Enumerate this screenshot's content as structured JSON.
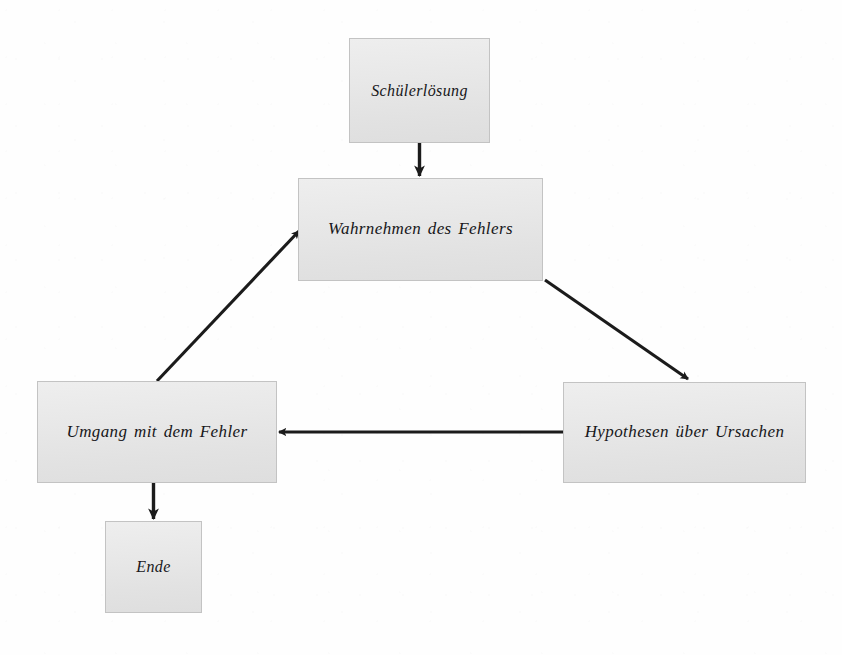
{
  "diagram": {
    "language": "de",
    "background_color": "#fefefe",
    "node_fill_color": "#e8e8e8",
    "node_border_color": "#c3c3c3",
    "edge_color": "#1b1b1b",
    "text_color": "#17171a",
    "nodes": [
      {
        "id": "schuelerloesung",
        "label": "Schülerlösung",
        "x": 349,
        "y": 38,
        "w": 141,
        "h": 105
      },
      {
        "id": "wahrnehmen",
        "label": "Wahrnehmen des Fehlers",
        "x": 298,
        "y": 178,
        "w": 245,
        "h": 103
      },
      {
        "id": "hypothesen",
        "label": "Hypothesen über Ursachen",
        "x": 563,
        "y": 382,
        "w": 243,
        "h": 101
      },
      {
        "id": "umgang",
        "label": "Umgang mit dem Fehler",
        "x": 37,
        "y": 381,
        "w": 240,
        "h": 102
      },
      {
        "id": "ende",
        "label": "Ende",
        "x": 105,
        "y": 521,
        "w": 97,
        "h": 92
      }
    ],
    "edges": [
      {
        "id": "edge-schuelerloesung-wahrnehmen",
        "from": "schuelerloesung",
        "to": "wahrnehmen",
        "kind": "vertical-down"
      },
      {
        "id": "edge-wahrnehmen-hypothesen",
        "from": "wahrnehmen",
        "to": "hypothesen",
        "kind": "diagonal-down-right"
      },
      {
        "id": "edge-hypothesen-umgang",
        "from": "hypothesen",
        "to": "umgang",
        "kind": "horizontal-left"
      },
      {
        "id": "edge-umgang-wahrnehmen",
        "from": "umgang",
        "to": "wahrnehmen",
        "kind": "diagonal-up-right"
      },
      {
        "id": "edge-umgang-ende",
        "from": "umgang",
        "to": "ende",
        "kind": "vertical-down"
      }
    ]
  }
}
